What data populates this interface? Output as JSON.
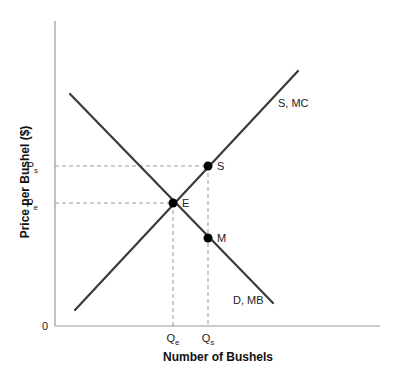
{
  "chart_data": {
    "type": "line",
    "title": "",
    "xlabel": "Number of Bushels",
    "ylabel": "Price per Bushel ($)",
    "origin_label": "0",
    "x_ticks": [
      {
        "label": "Q",
        "sub": "e",
        "x": 173
      },
      {
        "label": "Q",
        "sub": "s",
        "x": 208
      }
    ],
    "y_ticks": [
      {
        "label": "P",
        "sub": "s",
        "y": 166
      },
      {
        "label": "P",
        "sub": "e",
        "y": 203
      }
    ],
    "series": [
      {
        "name": "S, MC",
        "description": "Supply / marginal cost curve, upward sloping",
        "x1": 75,
        "y1": 310,
        "x2": 298,
        "y2": 71,
        "label_x": 278,
        "label_y": 107
      },
      {
        "name": "D, MB",
        "description": "Demand / marginal benefit curve, downward sloping",
        "x1": 70,
        "y1": 94,
        "x2": 273,
        "y2": 303,
        "label_x": 233,
        "label_y": 304
      }
    ],
    "points": [
      {
        "name": "E",
        "description": "Equilibrium (Qe, Pe)",
        "x": 173,
        "y": 203
      },
      {
        "name": "S",
        "description": "Point on supply at Qs (Qs, Ps)",
        "x": 208,
        "y": 166
      },
      {
        "name": "M",
        "description": "Point on demand at Qs",
        "x": 208,
        "y": 238
      }
    ],
    "axes": {
      "origin_x": 55,
      "origin_y": 326,
      "x_end": 380,
      "y_top": 21
    },
    "grid": false,
    "legend": "none (inline curve labels)",
    "colors": {
      "curve": "#3a3a3a",
      "axis": "#999999",
      "guide": "#999999",
      "point": "#000000"
    }
  }
}
